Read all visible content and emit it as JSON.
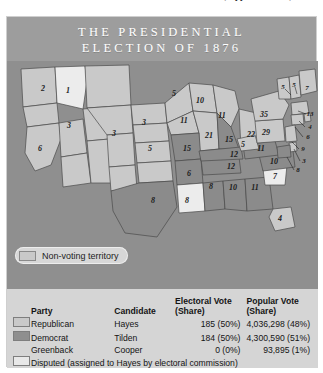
{
  "page_top_fragment": "tion, Appointment to, and C",
  "figure": {
    "title_line1": "THE PRESIDENTIAL",
    "title_line2": "ELECTION OF 1876"
  },
  "map": {
    "legend_pill": {
      "label": "Non-voting territory",
      "swatch_color": "#c9c9c9"
    },
    "colors": {
      "ocean": "#8f8f8f",
      "republican": "#c9c9c9",
      "democrat": "#8b8b8b",
      "disputed": "#ececec",
      "nonvoting": "#c9c9c9",
      "border": "#4a4a4a"
    },
    "state_labels": [
      {
        "name": "oregon",
        "value": "2",
        "x": 36,
        "y": 28
      },
      {
        "name": "idaho-territory-area",
        "value": "1",
        "x": 61,
        "y": 30
      },
      {
        "name": "nevada",
        "value": "3",
        "x": 62,
        "y": 65
      },
      {
        "name": "california",
        "value": "6",
        "x": 33,
        "y": 88
      },
      {
        "name": "colorado",
        "value": "3",
        "x": 107,
        "y": 73
      },
      {
        "name": "nebraska",
        "value": "3",
        "x": 137,
        "y": 62
      },
      {
        "name": "kansas",
        "value": "5",
        "x": 143,
        "y": 88
      },
      {
        "name": "minnesota",
        "value": "5",
        "x": 167,
        "y": 33
      },
      {
        "name": "iowa",
        "value": "11",
        "x": 177,
        "y": 60
      },
      {
        "name": "wisconsin",
        "value": "10",
        "x": 193,
        "y": 40
      },
      {
        "name": "michigan",
        "value": "11",
        "x": 215,
        "y": 55
      },
      {
        "name": "illinois",
        "value": "21",
        "x": 202,
        "y": 75
      },
      {
        "name": "indiana",
        "value": "15",
        "x": 222,
        "y": 79
      },
      {
        "name": "ohio",
        "value": "22",
        "x": 244,
        "y": 74
      },
      {
        "name": "missouri",
        "value": "15",
        "x": 180,
        "y": 88
      },
      {
        "name": "arkansas",
        "value": "6",
        "x": 182,
        "y": 113
      },
      {
        "name": "texas",
        "value": "8",
        "x": 146,
        "y": 140
      },
      {
        "name": "louisiana",
        "value": "8",
        "x": 180,
        "y": 140
      },
      {
        "name": "mississippi",
        "value": "8",
        "x": 204,
        "y": 126
      },
      {
        "name": "alabama",
        "value": "10",
        "x": 226,
        "y": 127
      },
      {
        "name": "georgia",
        "value": "11",
        "x": 248,
        "y": 127
      },
      {
        "name": "florida",
        "value": "4",
        "x": 273,
        "y": 158
      },
      {
        "name": "south-carolina",
        "value": "7",
        "x": 268,
        "y": 116
      },
      {
        "name": "north-carolina",
        "value": "10",
        "x": 267,
        "y": 101
      },
      {
        "name": "tennessee",
        "value": "12",
        "x": 224,
        "y": 106
      },
      {
        "name": "kentucky",
        "value": "12",
        "x": 227,
        "y": 94
      },
      {
        "name": "virginia",
        "value": "11",
        "x": 254,
        "y": 88
      },
      {
        "name": "west-virginia",
        "value": "5",
        "x": 236,
        "y": 84
      },
      {
        "name": "pennsylvania",
        "value": "29",
        "x": 259,
        "y": 72
      },
      {
        "name": "new-york",
        "value": "35",
        "x": 257,
        "y": 54
      },
      {
        "name": "vermont",
        "value": "5",
        "x": 276,
        "y": 26
      },
      {
        "name": "new-hampshire",
        "value": "5",
        "x": 287,
        "y": 24
      },
      {
        "name": "maine",
        "value": "7",
        "x": 300,
        "y": 27
      },
      {
        "name": "massachusetts",
        "value": "13",
        "x": 303,
        "y": 53
      },
      {
        "name": "rhode-island",
        "value": "4",
        "x": 303,
        "y": 66
      },
      {
        "name": "connecticut",
        "value": "6",
        "x": 301,
        "y": 76
      },
      {
        "name": "new-jersey",
        "value": "9",
        "x": 296,
        "y": 88
      },
      {
        "name": "delaware",
        "value": "3",
        "x": 297,
        "y": 100
      },
      {
        "name": "maryland",
        "value": "8",
        "x": 291,
        "y": 109
      }
    ]
  },
  "table": {
    "headers": {
      "party": "Party",
      "candidate": "Candidate",
      "electoral_line1": "Electoral Vote",
      "electoral_line2": "(Share)",
      "popular_line1": "Popular Vote",
      "popular_line2": "(Share)"
    },
    "rows": [
      {
        "party": "Republican",
        "candidate": "Hayes",
        "electoral": "185 (50%)",
        "popular": "4,036,298 (48%)",
        "swatch": "republican"
      },
      {
        "party": "Democrat",
        "candidate": "Tilden",
        "electoral": "184 (50%)",
        "popular": "4,300,590 (51%)",
        "swatch": "democrat"
      },
      {
        "party": "Greenback",
        "candidate": "Cooper",
        "electoral": "0 (0%)",
        "popular": "93,895 (1%)",
        "swatch": "none"
      }
    ],
    "note": "Disputed (assigned to Hayes by electoral commission)"
  }
}
